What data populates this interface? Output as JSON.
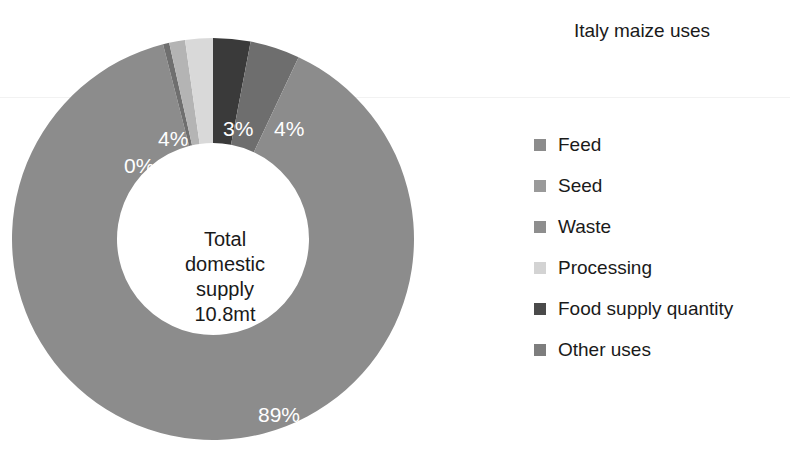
{
  "chart_data": {
    "type": "pie",
    "variant": "donut",
    "title": "Italy maize uses",
    "center_label_lines": [
      "Total",
      "domestic",
      "supply",
      "10.8mt"
    ],
    "center_total_value": "10.8mt",
    "units": "mt",
    "legend_position": "right",
    "grid": false,
    "categories": [
      "Feed",
      "Seed",
      "Waste",
      "Processing",
      "Food supply quantity",
      "Other uses"
    ],
    "values": [
      89,
      0,
      4,
      4,
      3,
      4
    ],
    "value_labels": [
      "89%",
      "0%",
      "4%",
      "4%",
      "3%",
      "4%"
    ],
    "colors": [
      "#8c8c8c",
      "#6f6f6f",
      "#b4b4b4",
      "#d9d9d9",
      "#3a3a3a",
      "#6e6e6e"
    ],
    "slices": [
      {
        "name": "Food supply quantity",
        "value": 3,
        "label": "3%",
        "color": "#3a3a3a",
        "start_deg": 0,
        "sweep_deg": 10.8,
        "label_x": 214,
        "label_y": 92
      },
      {
        "name": "Other uses",
        "value": 4,
        "label": "4%",
        "color": "#6e6e6e",
        "start_deg": 10.8,
        "sweep_deg": 14.4,
        "label_x": 261,
        "label_y": 92
      },
      {
        "name": "Feed",
        "value": 89,
        "label": "89%",
        "color": "#8c8c8c",
        "start_deg": 25.2,
        "sweep_deg": 320.4,
        "label_x": 247,
        "label_y": 383
      },
      {
        "name": "Seed",
        "value": 0,
        "label": "0%",
        "color": "#6f6f6f",
        "start_deg": 345.6,
        "sweep_deg": 1.8,
        "label_x": 119,
        "label_y": 129
      },
      {
        "name": "Waste",
        "value": 4,
        "label": "4%",
        "color": "#b4b4b4",
        "start_deg": 347.4,
        "sweep_deg": 4.6,
        "label_x": 152,
        "label_y": 106
      },
      {
        "name": "Processing",
        "value": 4,
        "label": "4%",
        "color": "#d9d9d9",
        "start_deg": 352.0,
        "sweep_deg": 8.0,
        "label_x": 152,
        "label_y": 106
      }
    ],
    "legend_entries": [
      {
        "label": "Feed",
        "color": "#8c8c8c"
      },
      {
        "label": "Seed",
        "color": "#9a9a9a"
      },
      {
        "label": "Waste",
        "color": "#8e8e8e"
      },
      {
        "label": "Processing",
        "color": "#d3d3d3"
      },
      {
        "label": "Food supply quantity",
        "color": "#4a4a4a"
      },
      {
        "label": "Other uses",
        "color": "#7d7d7d"
      }
    ]
  }
}
